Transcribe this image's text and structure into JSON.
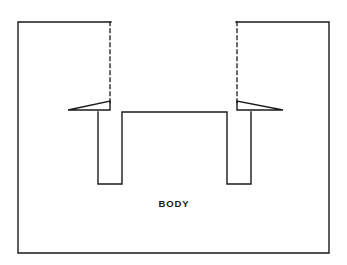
{
  "figure": {
    "domain": "Diagram",
    "kind": "engineering-cross-section",
    "title_label": "BODY",
    "background_color": "#ffffff",
    "line_color": "#1a1a1a",
    "fill_color": "#ffffff",
    "canvas": {
      "width": 347,
      "height": 265
    }
  },
  "labels": {
    "body": "BODY"
  },
  "geometry": {
    "outer_frame": {
      "name": "body-outline",
      "left": 18,
      "right": 329,
      "top": 22,
      "bottom": 253,
      "stroke_width": 1.4,
      "top_segments": [
        {
          "x1": 18,
          "x2": 111
        },
        {
          "x1": 236,
          "x2": 329
        }
      ]
    },
    "hidden_lines": [
      {
        "name": "hidden-line-left",
        "x": 110,
        "y1": 22,
        "y2": 104,
        "dash": "3.5 3.5"
      },
      {
        "name": "hidden-line-right",
        "x": 237,
        "y1": 22,
        "y2": 104,
        "dash": "3.5 3.5"
      }
    ],
    "slots": [
      {
        "name": "slot-left",
        "left_wall_x": 98,
        "right_wall_x": 122,
        "top_y": 112,
        "bottom_y": 184
      },
      {
        "name": "slot-right",
        "left_wall_x": 227,
        "right_wall_x": 251,
        "top_y": 112,
        "bottom_y": 184
      }
    ],
    "center_land": {
      "name": "center-land-surface",
      "x1": 122,
      "x2": 227,
      "y": 112
    },
    "flanges": [
      {
        "name": "flange-left",
        "tip_x": 68,
        "root_x": 110,
        "upper_y_at_root": 101,
        "lower_y": 110,
        "tip_y": 110
      },
      {
        "name": "flange-right",
        "tip_x": 283,
        "root_x": 237,
        "upper_y_at_root": 101,
        "lower_y": 110,
        "tip_y": 110
      }
    ],
    "body_label_position": {
      "x": 174,
      "y": 207
    }
  }
}
